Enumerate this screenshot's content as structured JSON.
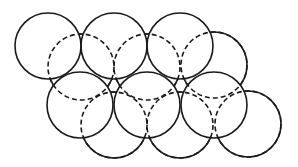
{
  "diagram": {
    "stroke_color": "#1a1a1a",
    "background": "#ffffff",
    "radius": 33,
    "upper_layer": [
      {
        "cx": 48,
        "cy": 46
      },
      {
        "cx": 114,
        "cy": 46
      },
      {
        "cx": 180,
        "cy": 46
      },
      {
        "cx": 80,
        "cy": 105
      },
      {
        "cx": 147,
        "cy": 105
      },
      {
        "cx": 214,
        "cy": 105
      }
    ],
    "lower_layer": [
      {
        "cx": 81,
        "cy": 67
      },
      {
        "cx": 147,
        "cy": 67
      },
      {
        "cx": 214,
        "cy": 65
      },
      {
        "cx": 114,
        "cy": 125
      },
      {
        "cx": 180,
        "cy": 125
      },
      {
        "cx": 248,
        "cy": 124
      }
    ]
  }
}
